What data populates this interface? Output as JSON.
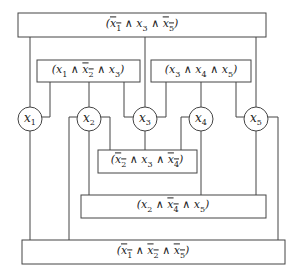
{
  "diagram": {
    "type": "clause-variable incidence graph",
    "variables": [
      {
        "id": "x1",
        "label": "x",
        "sub": "1",
        "cx": 30,
        "cy": 119
      },
      {
        "id": "x2",
        "label": "x",
        "sub": "2",
        "cx": 89,
        "cy": 119
      },
      {
        "id": "x3",
        "label": "x",
        "sub": "3",
        "cx": 145,
        "cy": 119
      },
      {
        "id": "x4",
        "label": "x",
        "sub": "4",
        "cx": 201,
        "cy": 119
      },
      {
        "id": "x5",
        "label": "x",
        "sub": "5",
        "cx": 256,
        "cy": 119
      }
    ],
    "clauses": [
      {
        "id": "c1",
        "text": "(x̄1 ∧ x3 ∧ x̄5)",
        "literals": [
          {
            "v": "1",
            "neg": true
          },
          {
            "v": "3",
            "neg": false
          },
          {
            "v": "5",
            "neg": true
          }
        ],
        "x": 18,
        "y": 13,
        "w": 248,
        "h": 24
      },
      {
        "id": "c2",
        "text": "(x1 ∧ x̄2 ∧ x3)",
        "literals": [
          {
            "v": "1",
            "neg": false
          },
          {
            "v": "2",
            "neg": true
          },
          {
            "v": "3",
            "neg": false
          }
        ],
        "x": 37,
        "y": 60,
        "w": 103,
        "h": 22
      },
      {
        "id": "c3",
        "text": "(x3 ∧ x4 ∧ x5)",
        "literals": [
          {
            "v": "3",
            "neg": false
          },
          {
            "v": "4",
            "neg": false
          },
          {
            "v": "5",
            "neg": false
          }
        ],
        "x": 151,
        "y": 60,
        "w": 100,
        "h": 22
      },
      {
        "id": "c4",
        "text": "(x̄2 ∧ x3 ∧ x̄4)",
        "literals": [
          {
            "v": "2",
            "neg": true
          },
          {
            "v": "3",
            "neg": false
          },
          {
            "v": "4",
            "neg": true
          }
        ],
        "x": 98,
        "y": 150,
        "w": 99,
        "h": 23
      },
      {
        "id": "c5",
        "text": "(x2 ∧ x̄4 ∧ x5)",
        "literals": [
          {
            "v": "2",
            "neg": false
          },
          {
            "v": "4",
            "neg": true
          },
          {
            "v": "5",
            "neg": false
          }
        ],
        "x": 81,
        "y": 195,
        "w": 185,
        "h": 23
      },
      {
        "id": "c6",
        "text": "(x̄1 ∧ x̄2 ∧ x̄5)",
        "literals": [
          {
            "v": "1",
            "neg": true
          },
          {
            "v": "2",
            "neg": true
          },
          {
            "v": "5",
            "neg": true
          }
        ],
        "x": 22,
        "y": 240,
        "w": 263,
        "h": 24
      }
    ]
  }
}
